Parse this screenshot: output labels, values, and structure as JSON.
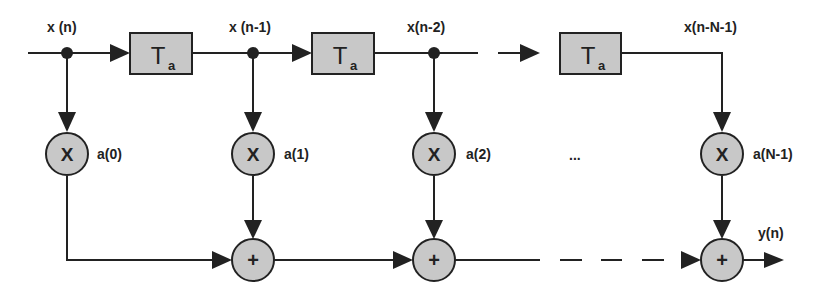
{
  "diagram": {
    "type": "FIR filter (tapped delay line)",
    "colors": {
      "stroke": "#222222",
      "fill": "#c8c8c8",
      "background": "#ffffff"
    },
    "signals": {
      "input": "x (n)",
      "tap1": "x (n-1)",
      "tap2": "x(n-2)",
      "tapLast": "x(n-N-1)",
      "output": "y(n)"
    },
    "delays": [
      {
        "symbol": "T",
        "subscript": "a"
      },
      {
        "symbol": "T",
        "subscript": "a"
      },
      {
        "symbol": "T",
        "subscript": "a"
      }
    ],
    "multipliers": [
      {
        "symbol": "X",
        "coef": "a(0)"
      },
      {
        "symbol": "X",
        "coef": "a(1)"
      },
      {
        "symbol": "X",
        "coef": "a(2)"
      },
      {
        "symbol": "X",
        "coef": "a(N-1)"
      }
    ],
    "adders": [
      {
        "symbol": "+"
      },
      {
        "symbol": "+"
      },
      {
        "symbol": "+"
      }
    ],
    "ellipsis": "..."
  }
}
